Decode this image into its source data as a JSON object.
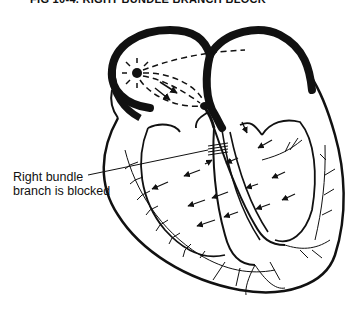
{
  "figure": {
    "caption": "FIG 10-4. RIGHT BUNDLE BRANCH BLOCK"
  },
  "annotations": [
    {
      "line1": "Right bundle",
      "line2": "branch is blocked"
    }
  ],
  "elements": {
    "sa_node": "sinoatrial-node",
    "av_node": "atrioventricular-node",
    "block_marker": "hatch-marks-on-right-bundle-branch",
    "impulse_arrows": "conduction-direction-arrows",
    "purkinje_fibers": "branching-fibers"
  },
  "colors": {
    "ink": "#111111",
    "background": "#ffffff"
  }
}
